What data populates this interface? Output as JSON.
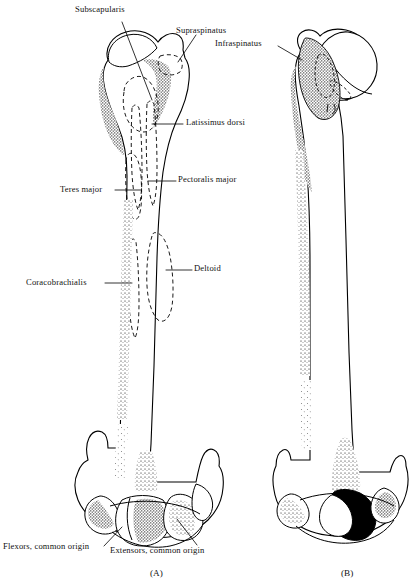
{
  "figure": {
    "ink_color": "#000000",
    "background_color": "#ffffff",
    "panels": [
      {
        "id": "A",
        "label": "(A)",
        "view": "anterior",
        "label_x": 150,
        "label_y": 568
      },
      {
        "id": "B",
        "label": "(B)",
        "view": "posterior",
        "label_x": 341,
        "label_y": 568
      }
    ]
  },
  "labels": [
    {
      "name": "subscapularis",
      "text": "Subscapularis",
      "x": 75,
      "y": 4,
      "align": "left"
    },
    {
      "name": "supraspinatus",
      "text": "Supraspinatus",
      "x": 176,
      "y": 25,
      "align": "left"
    },
    {
      "name": "infraspinatus",
      "text": "Infraspinatus",
      "x": 215,
      "y": 38,
      "align": "left"
    },
    {
      "name": "latissimus-dorsi",
      "text": "Latissimus dorsi",
      "x": 186,
      "y": 117,
      "align": "left"
    },
    {
      "name": "pectoralis-major",
      "text": "Pectoralis major",
      "x": 178,
      "y": 174,
      "align": "left"
    },
    {
      "name": "teres-major",
      "text": "Teres major",
      "x": 60,
      "y": 184,
      "align": "left"
    },
    {
      "name": "deltoid",
      "text": "Deltoid",
      "x": 194,
      "y": 263,
      "align": "left"
    },
    {
      "name": "coracobrachialis",
      "text": "Coracobrachialis",
      "x": 26,
      "y": 277,
      "align": "left"
    },
    {
      "name": "flexors-common-origin",
      "text": "Flexors, common origin",
      "x": 3,
      "y": 541,
      "align": "left"
    },
    {
      "name": "extensors-common-origin",
      "text": "Extensors, common origin",
      "x": 110,
      "y": 545,
      "align": "left"
    }
  ],
  "leader_lines": [
    {
      "name": "leader-subscapularis",
      "points": "122,22 152,100"
    },
    {
      "name": "leader-supraspinatus",
      "points": "196,35 178,62"
    },
    {
      "name": "leader-latissimus-dorsi",
      "points": "183,124 152,124"
    },
    {
      "name": "leader-pectoralis-major",
      "points": "176,181 148,181"
    },
    {
      "name": "leader-teres-major",
      "points": "115,190 141,190"
    },
    {
      "name": "leader-deltoid",
      "points": "192,270 166,270"
    },
    {
      "name": "leader-coracobrachialis",
      "points": "105,283 132,283"
    },
    {
      "name": "leader-flexors",
      "points": "104,546 122,527"
    },
    {
      "name": "leader-extensors",
      "points": "197,545 177,519"
    },
    {
      "name": "leader-infraspinatus-b",
      "points": "278,46 302,60"
    }
  ]
}
